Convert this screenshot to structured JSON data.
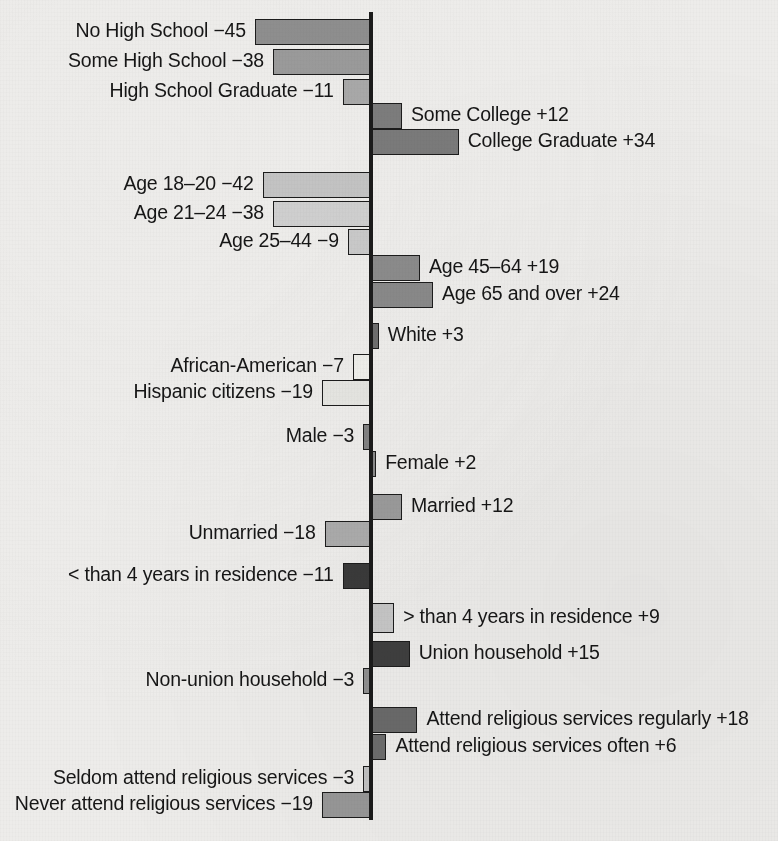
{
  "chart_data": {
    "type": "bar",
    "title": "",
    "subtitle": "",
    "xlabel": "",
    "ylabel": "",
    "orientation": "horizontal-diverging",
    "grid": false,
    "legend": null,
    "axis": {
      "zero_line": 0,
      "xlim": [
        -50,
        40
      ],
      "note": "Values are point deviations from the average; negative bars extend left of the zero axis, positive bars extend right."
    },
    "groups": [
      {
        "name": "Education",
        "items": [
          {
            "label": "No High School",
            "value": -45,
            "display": "No High School −45",
            "shade": "#8e8e8e"
          },
          {
            "label": "Some High School",
            "value": -38,
            "display": "Some High School −38",
            "shade": "#9a9a9a"
          },
          {
            "label": "High School Graduate",
            "value": -11,
            "display": "High School Graduate −11",
            "shade": "#a8a8a8"
          },
          {
            "label": "Some College",
            "value": 12,
            "display": "Some College +12",
            "shade": "#7c7c7c"
          },
          {
            "label": "College Graduate",
            "value": 34,
            "display": "College Graduate +34",
            "shade": "#7a7a7a"
          }
        ]
      },
      {
        "name": "Age",
        "items": [
          {
            "label": "Age 18–20",
            "value": -42,
            "display": "Age 18–20 −42",
            "shade": "#c3c3c3"
          },
          {
            "label": "Age 21–24",
            "value": -38,
            "display": "Age 21–24 −38",
            "shade": "#cfcfcf"
          },
          {
            "label": "Age 25–44",
            "value": -9,
            "display": "Age 25–44 −9",
            "shade": "#c9c9c9"
          },
          {
            "label": "Age 45–64",
            "value": 19,
            "display": "Age 45–64 +19",
            "shade": "#8b8b8b"
          },
          {
            "label": "Age 65 and over",
            "value": 24,
            "display": "Age 65 and over +24",
            "shade": "#898989"
          }
        ]
      },
      {
        "name": "Race and ethnicity",
        "items": [
          {
            "label": "White",
            "value": 3,
            "display": "White +3",
            "shade": "#6f6f6f"
          },
          {
            "label": "African-American",
            "value": -7,
            "display": "African-American −7",
            "shade": "#eeeeea"
          },
          {
            "label": "Hispanic citizens",
            "value": -19,
            "display": "Hispanic citizens −19",
            "shade": "#e5e5e1"
          }
        ]
      },
      {
        "name": "Gender",
        "items": [
          {
            "label": "Male",
            "value": -3,
            "display": "Male −3",
            "shade": "#828282"
          },
          {
            "label": "Female",
            "value": 2,
            "display": "Female +2",
            "shade": "#8a8a8a"
          }
        ]
      },
      {
        "name": "Marital status",
        "items": [
          {
            "label": "Married",
            "value": 12,
            "display": "Married +12",
            "shade": "#9b9b9b"
          },
          {
            "label": "Unmarried",
            "value": -18,
            "display": "Unmarried −18",
            "shade": "#ababab"
          }
        ]
      },
      {
        "name": "Residential stability",
        "items": [
          {
            "label": "< than 4 years in residence",
            "value": -11,
            "display": "< than 4 years in residence −11",
            "shade": "#3a3a3a"
          },
          {
            "label": "> than 4 years in residence",
            "value": 9,
            "display": "> than 4 years in residence +9",
            "shade": "#c6c6c6"
          }
        ]
      },
      {
        "name": "Union membership",
        "items": [
          {
            "label": "Union household",
            "value": 15,
            "display": "Union household +15",
            "shade": "#3f3f3f"
          },
          {
            "label": "Non-union household",
            "value": -3,
            "display": "Non-union household −3",
            "shade": "#8f8f8f"
          }
        ]
      },
      {
        "name": "Religious attendance",
        "items": [
          {
            "label": "Attend religious services regularly",
            "value": 18,
            "display": "Attend religious services regularly +18",
            "shade": "#6a6a6a"
          },
          {
            "label": "Attend religious services often",
            "value": 6,
            "display": "Attend religious services often +6",
            "shade": "#6d6d6d"
          },
          {
            "label": "Seldom attend religious services",
            "value": -3,
            "display": "Seldom attend religious services −3",
            "shade": "#c0c0c0"
          },
          {
            "label": "Never attend religious services",
            "value": -19,
            "display": "Never attend religious services −19",
            "shade": "#979797"
          }
        ]
      }
    ],
    "rows": [
      {
        "display": "No High School −45",
        "value": -45,
        "shade": "#8e8e8e",
        "y": 19,
        "h": 26
      },
      {
        "display": "Some High School −38",
        "value": -38,
        "shade": "#9a9a9a",
        "y": 49,
        "h": 26
      },
      {
        "display": "High School Graduate −11",
        "value": -11,
        "shade": "#a8a8a8",
        "y": 79,
        "h": 26
      },
      {
        "display": "Some College +12",
        "value": 12,
        "shade": "#7c7c7c",
        "y": 103,
        "h": 26
      },
      {
        "display": "College Graduate +34",
        "value": 34,
        "shade": "#7a7a7a",
        "y": 129,
        "h": 26
      },
      {
        "display": "Age 18–20 −42",
        "value": -42,
        "shade": "#c3c3c3",
        "y": 172,
        "h": 26
      },
      {
        "display": "Age 21–24 −38",
        "value": -38,
        "shade": "#cfcfcf",
        "y": 201,
        "h": 26
      },
      {
        "display": "Age 25–44 −9",
        "value": -9,
        "shade": "#c9c9c9",
        "y": 229,
        "h": 26
      },
      {
        "display": "Age 45–64 +19",
        "value": 19,
        "shade": "#8b8b8b",
        "y": 255,
        "h": 26
      },
      {
        "display": "Age 65 and over +24",
        "value": 24,
        "shade": "#898989",
        "y": 282,
        "h": 26
      },
      {
        "display": "White +3",
        "value": 3,
        "shade": "#6f6f6f",
        "y": 323,
        "h": 26
      },
      {
        "display": "African-American −7",
        "value": -7,
        "shade": "#eeeeea",
        "y": 354,
        "h": 26
      },
      {
        "display": "Hispanic citizens −19",
        "value": -19,
        "shade": "#e5e5e1",
        "y": 380,
        "h": 26
      },
      {
        "display": "Male −3",
        "value": -3,
        "shade": "#828282",
        "y": 424,
        "h": 26
      },
      {
        "display": "Female +2",
        "value": 2,
        "shade": "#8a8a8a",
        "y": 451,
        "h": 26
      },
      {
        "display": "Married +12",
        "value": 12,
        "shade": "#9b9b9b",
        "y": 494,
        "h": 26
      },
      {
        "display": "Unmarried −18",
        "value": -18,
        "shade": "#ababab",
        "y": 521,
        "h": 26
      },
      {
        "display": "< than 4 years in residence −11",
        "value": -11,
        "shade": "#3a3a3a",
        "y": 563,
        "h": 26
      },
      {
        "display": "> than 4 years in residence +9",
        "value": 9,
        "shade": "#c6c6c6",
        "y": 603,
        "h": 30
      },
      {
        "display": "Union household +15",
        "value": 15,
        "shade": "#3f3f3f",
        "y": 641,
        "h": 26
      },
      {
        "display": "Non-union household −3",
        "value": -3,
        "shade": "#8f8f8f",
        "y": 668,
        "h": 26
      },
      {
        "display": "Attend religious services regularly +18",
        "value": 18,
        "shade": "#6a6a6a",
        "y": 707,
        "h": 26
      },
      {
        "display": "Attend religious services often +6",
        "value": 6,
        "shade": "#6d6d6d",
        "y": 734,
        "h": 26
      },
      {
        "display": "Seldom attend religious services −3",
        "value": -3,
        "shade": "#c0c0c0",
        "y": 766,
        "h": 26
      },
      {
        "display": "Never attend religious services −19",
        "value": -19,
        "shade": "#979797",
        "y": 792,
        "h": 26
      }
    ]
  },
  "render": {
    "zero_x": 371,
    "px_per_unit": 2.58,
    "axis_top": 12,
    "axis_bottom": 820,
    "axis_width": 4,
    "axis_color": "#1b1b1b",
    "background_color": "#edecea",
    "label_gap": 9
  }
}
